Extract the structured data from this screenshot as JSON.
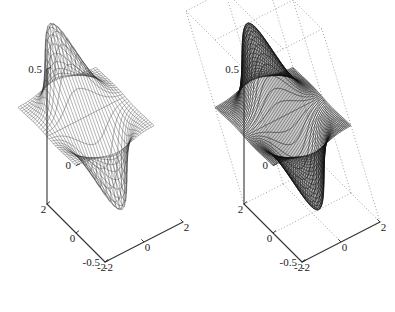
{
  "figure": {
    "kind": "two-panel-3d-surface-figure",
    "background": "#ffffff",
    "panels": [
      "left",
      "right"
    ]
  },
  "chart_data": [
    {
      "id": "left-mesh-plot",
      "type": "surface",
      "render_style": "wireframe-mesh",
      "title": "",
      "xlabel": "",
      "ylabel": "",
      "zlabel": "",
      "xlim": [
        -2,
        2
      ],
      "ylim": [
        -2,
        2
      ],
      "zlim": [
        -0.5,
        0.5
      ],
      "xticks": [
        -2,
        0,
        2
      ],
      "ytypes": [
        -2,
        0,
        2
      ],
      "yticks": [
        -2,
        0,
        2
      ],
      "zticks": [
        -0.5,
        0,
        0.5
      ],
      "xtick_labels": [
        "-2",
        "0",
        "2"
      ],
      "ytick_labels": [
        "-2",
        "0",
        "2"
      ],
      "ztick_labels": [
        "-0.5",
        "0",
        "0.5"
      ],
      "grid": false,
      "box": false,
      "legend": null,
      "function": "z = x * exp(-(x^2) - (y^2))",
      "zmax": 0.4289,
      "zmin": -0.4289,
      "peak_xy": [
        0.7071,
        0.0
      ],
      "trough_xy": [
        -0.7071,
        0.0
      ],
      "mesh_n": 31,
      "line_color": "#2a2a2a",
      "view_azimuth_deg": -37.5,
      "view_elevation_deg": 30
    },
    {
      "id": "right-surf-plot",
      "type": "surface",
      "render_style": "dense-dark-mesh",
      "title": "",
      "xlabel": "",
      "ylabel": "",
      "zlabel": "",
      "xlim": [
        -2,
        2
      ],
      "ylim": [
        -2,
        2
      ],
      "zlim": [
        -0.5,
        0.5
      ],
      "xticks": [
        -2,
        0,
        2
      ],
      "yticks": [
        -2,
        0,
        2
      ],
      "zticks": [
        -0.5,
        0,
        0.5
      ],
      "xtick_labels": [
        "-2",
        "0",
        "2"
      ],
      "ytick_labels": [
        "-2",
        "0",
        "2"
      ],
      "ztick_labels": [
        "-0.5",
        "0",
        "0.5"
      ],
      "grid": true,
      "grid_style": "dotted",
      "grid_color": "#7a7a7a",
      "box": true,
      "legend": null,
      "function": "z = x * exp(-(x^2) - (y^2))",
      "zmax": 0.4289,
      "zmin": -0.4289,
      "peak_xy": [
        0.7071,
        0.0
      ],
      "trough_xy": [
        -0.7071,
        0.0
      ],
      "mesh_n": 61,
      "line_color": "#111111",
      "view_azimuth_deg": -37.5,
      "view_elevation_deg": 30
    }
  ],
  "left_panel": {
    "z_ticks": [
      {
        "label": "0.5",
        "value": 0.5
      },
      {
        "label": "0",
        "value": 0.0
      },
      {
        "label": "-0.5",
        "value": -0.5
      }
    ],
    "x_ticks": [
      {
        "label": "2",
        "value": 2
      },
      {
        "label": "0",
        "value": 0
      },
      {
        "label": "-2",
        "value": -2
      }
    ],
    "y_ticks": [
      {
        "label": "-2",
        "value": -2
      },
      {
        "label": "0",
        "value": 0
      },
      {
        "label": "2",
        "value": 2
      }
    ]
  },
  "right_panel": {
    "z_ticks": [
      {
        "label": "0.5",
        "value": 0.5
      },
      {
        "label": "0",
        "value": 0.0
      },
      {
        "label": "-0.5",
        "value": -0.5
      }
    ],
    "x_ticks": [
      {
        "label": "2",
        "value": 2
      },
      {
        "label": "0",
        "value": 0
      },
      {
        "label": "-2",
        "value": -2
      }
    ],
    "y_ticks": [
      {
        "label": "-2",
        "value": -2
      },
      {
        "label": "0",
        "value": 0
      },
      {
        "label": "2",
        "value": 2
      }
    ]
  }
}
